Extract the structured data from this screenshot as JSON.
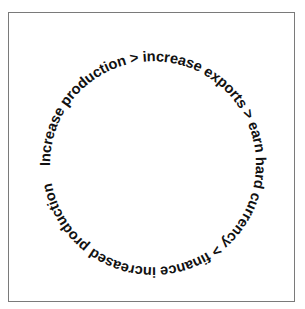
{
  "diagram": {
    "type": "circular-cycle",
    "text": "Increase production > increase exports > earn hard currency > finance increased production",
    "steps": [
      "Increase production",
      "increase exports",
      "earn hard currency",
      "finance increased production"
    ],
    "separator": ">",
    "colors": {
      "text": "#111111",
      "border": "#7a7a7a",
      "background": "#ffffff"
    }
  }
}
